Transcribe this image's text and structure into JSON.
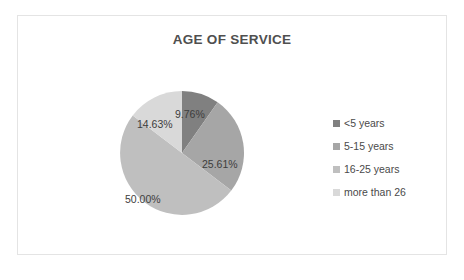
{
  "chart_data": {
    "type": "pie",
    "title": "AGE OF SERVICE",
    "xlabel": "",
    "ylabel": "",
    "legend_position": "right",
    "grid": false,
    "categories": [
      "<5 years",
      "5-15 years",
      "16-25 years",
      "more than 26"
    ],
    "values": [
      9.76,
      25.61,
      50.0,
      14.63
    ],
    "data_labels": [
      "9.76%",
      "25.61%",
      "50.00%",
      "14.63%"
    ],
    "colors": [
      "#808080",
      "#a6a6a6",
      "#bfbfbf",
      "#d9d9d9"
    ],
    "start_angle_deg": 0,
    "direction": "clockwise"
  },
  "frame": {
    "border_color": "#e4e4e4",
    "background": "#ffffff"
  },
  "title": {
    "text": "AGE OF SERVICE",
    "color": "#4f4f4f"
  },
  "legend": {
    "items": [
      {
        "label": "<5 years",
        "color": "#808080"
      },
      {
        "label": "5-15 years",
        "color": "#a6a6a6"
      },
      {
        "label": "16-25 years",
        "color": "#bfbfbf"
      },
      {
        "label": "more than 26",
        "color": "#d9d9d9"
      }
    ]
  },
  "slices": [
    {
      "label": "9.76%",
      "value": 9.76,
      "category": "<5 years",
      "color": "#808080"
    },
    {
      "label": "25.61%",
      "value": 25.61,
      "category": "5-15 years",
      "color": "#a6a6a6"
    },
    {
      "label": "50.00%",
      "value": 50.0,
      "category": "16-25 years",
      "color": "#bfbfbf"
    },
    {
      "label": "14.63%",
      "value": 14.63,
      "category": "more than 26",
      "color": "#d9d9d9"
    }
  ]
}
